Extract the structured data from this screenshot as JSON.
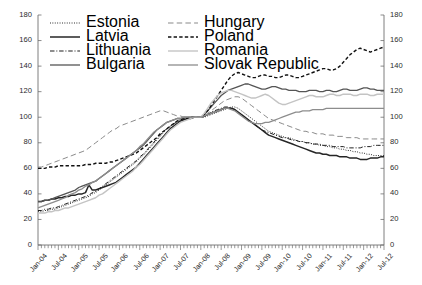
{
  "chart_data": {
    "type": "line",
    "title": "",
    "xlabel": "",
    "ylabel": "",
    "ylim": [
      0,
      180
    ],
    "ytick_step": 20,
    "yticks": [
      0,
      20,
      40,
      60,
      80,
      100,
      120,
      140,
      160,
      180
    ],
    "yticks_right": [
      0,
      20,
      40,
      60,
      80,
      100,
      120,
      140,
      160,
      180
    ],
    "grid": false,
    "dual_axis": true,
    "legend_position": "top-left",
    "x_tick_labels": [
      "Jan-04",
      "Jul-04",
      "Jan-05",
      "Jul-05",
      "Jan-06",
      "Jul-06",
      "Jan-07",
      "Jul-07",
      "Jan-08",
      "Jul-08",
      "Jan-09",
      "Jul-09",
      "Jan-10",
      "Jul-10",
      "Jan-11",
      "Jul-11",
      "Jan-12",
      "Jul-12"
    ],
    "x_tick_indices": [
      0,
      6,
      12,
      18,
      24,
      30,
      36,
      42,
      48,
      54,
      60,
      66,
      72,
      78,
      84,
      90,
      96,
      102
    ],
    "x_minor_tick_count": 103,
    "x_range_label": "Jan-04 to Jul-12 (monthly)",
    "index_base_note": "Index, Jan-08 = 100",
    "series": [
      {
        "name": "Estonia",
        "style": "dotted",
        "color": "#1a1a1a",
        "values": [
          26,
          26,
          27,
          27,
          28,
          28,
          29,
          30,
          31,
          32,
          33,
          34,
          35,
          36,
          37,
          38,
          40,
          41,
          43,
          45,
          47,
          49,
          51,
          53,
          55,
          57,
          59,
          61,
          63,
          65,
          68,
          70,
          73,
          76,
          79,
          82,
          85,
          88,
          91,
          93,
          95,
          97,
          98,
          99,
          99,
          100,
          100,
          100,
          100,
          100,
          101,
          102,
          103,
          104,
          105,
          106,
          107,
          108,
          108,
          107,
          105,
          103,
          101,
          99,
          97,
          95,
          93,
          91,
          89,
          88,
          87,
          86,
          85,
          84,
          84,
          83,
          82,
          81,
          81,
          80,
          80,
          79,
          79,
          78,
          78,
          77,
          77,
          76,
          76,
          75,
          75,
          74,
          74,
          73,
          73,
          72,
          72,
          71,
          71,
          70,
          70,
          70,
          70
        ]
      },
      {
        "name": "Latvia",
        "style": "solid",
        "color": "#262626",
        "width": 1.5,
        "values": [
          34,
          34,
          35,
          35,
          36,
          36,
          37,
          37,
          38,
          38,
          39,
          39,
          40,
          40,
          41,
          47,
          43,
          43,
          44,
          45,
          46,
          47,
          48,
          49,
          51,
          53,
          55,
          57,
          59,
          61,
          64,
          67,
          70,
          73,
          76,
          79,
          82,
          85,
          88,
          91,
          93,
          95,
          97,
          98,
          99,
          99,
          100,
          100,
          100,
          101,
          102,
          103,
          104,
          105,
          106,
          107,
          107,
          107,
          106,
          104,
          102,
          100,
          98,
          96,
          94,
          92,
          90,
          88,
          86,
          85,
          84,
          83,
          82,
          81,
          80,
          79,
          78,
          77,
          76,
          75,
          74,
          73,
          72,
          72,
          71,
          71,
          70,
          70,
          70,
          69,
          69,
          69,
          68,
          68,
          68,
          67,
          67,
          67,
          68,
          68,
          68,
          69,
          69
        ]
      },
      {
        "name": "Lithuania",
        "style": "dashdot",
        "color": "#1f1f1f",
        "values": [
          27,
          27,
          28,
          28,
          29,
          29,
          30,
          31,
          32,
          33,
          34,
          35,
          36,
          37,
          38,
          39,
          41,
          42,
          44,
          46,
          48,
          50,
          52,
          54,
          56,
          58,
          60,
          62,
          64,
          66,
          69,
          71,
          74,
          77,
          80,
          83,
          86,
          89,
          91,
          93,
          95,
          96,
          97,
          98,
          99,
          99,
          100,
          100,
          100,
          101,
          102,
          104,
          105,
          106,
          107,
          108,
          108,
          107,
          106,
          104,
          102,
          100,
          98,
          96,
          94,
          92,
          90,
          89,
          88,
          87,
          86,
          85,
          84,
          84,
          83,
          82,
          82,
          81,
          81,
          80,
          80,
          79,
          79,
          79,
          78,
          78,
          78,
          77,
          77,
          77,
          77,
          76,
          76,
          76,
          76,
          76,
          77,
          77,
          77,
          78,
          78,
          78,
          78
        ]
      },
      {
        "name": "Bulgaria",
        "style": "solid",
        "color": "#555555",
        "width": 1.3,
        "values": [
          34,
          34,
          35,
          35,
          36,
          37,
          38,
          39,
          40,
          41,
          42,
          43,
          45,
          46,
          47,
          48,
          49,
          50,
          52,
          54,
          56,
          58,
          60,
          62,
          64,
          66,
          68,
          70,
          72,
          74,
          76,
          78,
          81,
          84,
          87,
          90,
          92,
          94,
          96,
          97,
          98,
          99,
          99,
          100,
          100,
          100,
          100,
          100,
          100,
          102,
          105,
          108,
          111,
          114,
          117,
          119,
          121,
          122,
          123,
          124,
          125,
          126,
          126,
          125,
          124,
          123,
          122,
          122,
          123,
          124,
          124,
          123,
          122,
          122,
          121,
          121,
          121,
          120,
          120,
          120,
          121,
          121,
          121,
          120,
          120,
          121,
          121,
          120,
          120,
          121,
          122,
          122,
          121,
          121,
          121,
          122,
          123,
          123,
          122,
          122,
          121,
          121,
          121
        ]
      },
      {
        "name": "Hungary",
        "style": "longdash",
        "color": "#8a8a8a",
        "values": [
          61,
          61,
          62,
          63,
          64,
          65,
          66,
          67,
          68,
          69,
          70,
          71,
          72,
          73,
          74,
          76,
          78,
          80,
          82,
          84,
          86,
          88,
          90,
          91,
          93,
          94,
          95,
          96,
          97,
          98,
          99,
          100,
          101,
          102,
          103,
          104,
          105,
          105,
          104,
          103,
          102,
          101,
          101,
          100,
          100,
          100,
          100,
          100,
          100,
          101,
          103,
          105,
          107,
          109,
          111,
          113,
          114,
          115,
          116,
          116,
          115,
          113,
          111,
          109,
          107,
          105,
          103,
          101,
          99,
          98,
          97,
          96,
          95,
          94,
          93,
          92,
          91,
          90,
          89,
          89,
          88,
          88,
          87,
          87,
          87,
          86,
          86,
          86,
          85,
          85,
          85,
          84,
          84,
          84,
          84,
          83,
          83,
          83,
          83,
          83,
          83,
          83,
          83
        ]
      },
      {
        "name": "Poland",
        "style": "dashed",
        "color": "#111111",
        "width": 1.4,
        "values": [
          60,
          60,
          60,
          61,
          61,
          61,
          62,
          62,
          62,
          62,
          62,
          62,
          62,
          62,
          63,
          63,
          63,
          64,
          64,
          64,
          64,
          65,
          65,
          66,
          67,
          68,
          69,
          70,
          71,
          72,
          74,
          76,
          78,
          80,
          82,
          84,
          87,
          89,
          91,
          93,
          95,
          97,
          98,
          99,
          99,
          100,
          100,
          100,
          100,
          102,
          105,
          109,
          113,
          117,
          121,
          125,
          129,
          132,
          134,
          135,
          134,
          133,
          132,
          131,
          131,
          132,
          133,
          133,
          132,
          132,
          131,
          131,
          132,
          133,
          133,
          132,
          131,
          131,
          132,
          133,
          134,
          135,
          136,
          137,
          138,
          138,
          137,
          137,
          138,
          140,
          143,
          146,
          149,
          151,
          153,
          154,
          153,
          152,
          151,
          152,
          153,
          154,
          155
        ]
      },
      {
        "name": "Romania",
        "style": "solid",
        "color": "#c4c4c4",
        "width": 1.4,
        "values": [
          25,
          25,
          25,
          26,
          26,
          27,
          27,
          28,
          29,
          29,
          30,
          31,
          32,
          33,
          34,
          35,
          36,
          37,
          39,
          40,
          42,
          44,
          46,
          48,
          50,
          52,
          54,
          56,
          58,
          61,
          63,
          66,
          69,
          72,
          75,
          78,
          81,
          84,
          87,
          90,
          92,
          94,
          96,
          97,
          98,
          99,
          100,
          100,
          100,
          103,
          107,
          111,
          114,
          117,
          119,
          120,
          121,
          121,
          120,
          119,
          118,
          117,
          116,
          115,
          115,
          116,
          117,
          118,
          117,
          115,
          113,
          111,
          110,
          110,
          111,
          112,
          113,
          114,
          115,
          116,
          117,
          117,
          116,
          116,
          116,
          117,
          118,
          118,
          117,
          117,
          118,
          118,
          118,
          117,
          117,
          118,
          118,
          118,
          117,
          117,
          118,
          118,
          118
        ]
      },
      {
        "name": "Slovak Republic",
        "style": "solid",
        "color": "#8d8d8d",
        "width": 1.3,
        "values": [
          29,
          30,
          31,
          32,
          33,
          34,
          35,
          36,
          37,
          39,
          40,
          41,
          43,
          44,
          46,
          47,
          49,
          50,
          52,
          54,
          56,
          58,
          60,
          62,
          64,
          66,
          68,
          70,
          72,
          74,
          77,
          79,
          82,
          85,
          88,
          90,
          92,
          94,
          96,
          97,
          98,
          99,
          99,
          100,
          100,
          100,
          100,
          100,
          100,
          101,
          102,
          103,
          104,
          105,
          106,
          107,
          107,
          106,
          105,
          103,
          101,
          99,
          97,
          96,
          95,
          95,
          95,
          96,
          96,
          97,
          98,
          99,
          100,
          101,
          102,
          103,
          104,
          104,
          105,
          105,
          105,
          106,
          106,
          106,
          106,
          107,
          107,
          107,
          107,
          107,
          107,
          107,
          107,
          107,
          107,
          107,
          107,
          107,
          107,
          107,
          107,
          107,
          107
        ]
      }
    ]
  },
  "legend": {
    "items": [
      {
        "label": "Estonia",
        "style": "dotted"
      },
      {
        "label": "Latvia",
        "style": "solid"
      },
      {
        "label": "Lithuania",
        "style": "dashdot"
      },
      {
        "label": "Bulgaria",
        "style": "solid"
      },
      {
        "label": "Hungary",
        "style": "longdash"
      },
      {
        "label": "Poland",
        "style": "dashed"
      },
      {
        "label": "Romania",
        "style": "solid"
      },
      {
        "label": "Slovak Republic",
        "style": "solid"
      }
    ]
  },
  "colors": {
    "axis": "#6f6f6f",
    "text": "#2b2b2b",
    "background": "#ffffff"
  }
}
